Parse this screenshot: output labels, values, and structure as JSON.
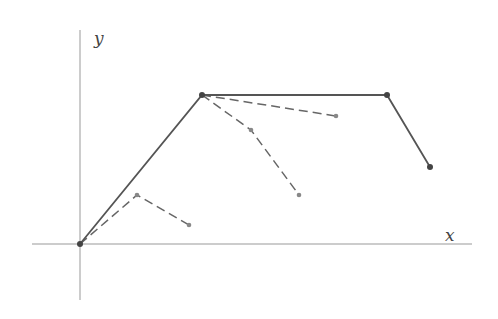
{
  "diagram": {
    "axes": {
      "x_label": "x",
      "y_label": "y",
      "origin": [
        80,
        244
      ],
      "x_axis": {
        "from": 32,
        "to": 472
      },
      "y_axis": {
        "from": 30,
        "to": 300
      }
    },
    "solid_path": {
      "points": [
        [
          80,
          244
        ],
        [
          202,
          95
        ],
        [
          387,
          95
        ],
        [
          430,
          167
        ]
      ],
      "color": "#555555"
    },
    "dashed_paths": [
      {
        "points": [
          [
            80,
            244
          ],
          [
            137,
            195
          ],
          [
            189,
            225
          ]
        ]
      },
      {
        "points": [
          [
            202,
            95
          ],
          [
            251,
            130
          ],
          [
            299,
            195
          ]
        ]
      },
      {
        "points": [
          [
            202,
            95
          ],
          [
            336,
            116
          ]
        ]
      }
    ],
    "dashed_color": "#666666"
  }
}
